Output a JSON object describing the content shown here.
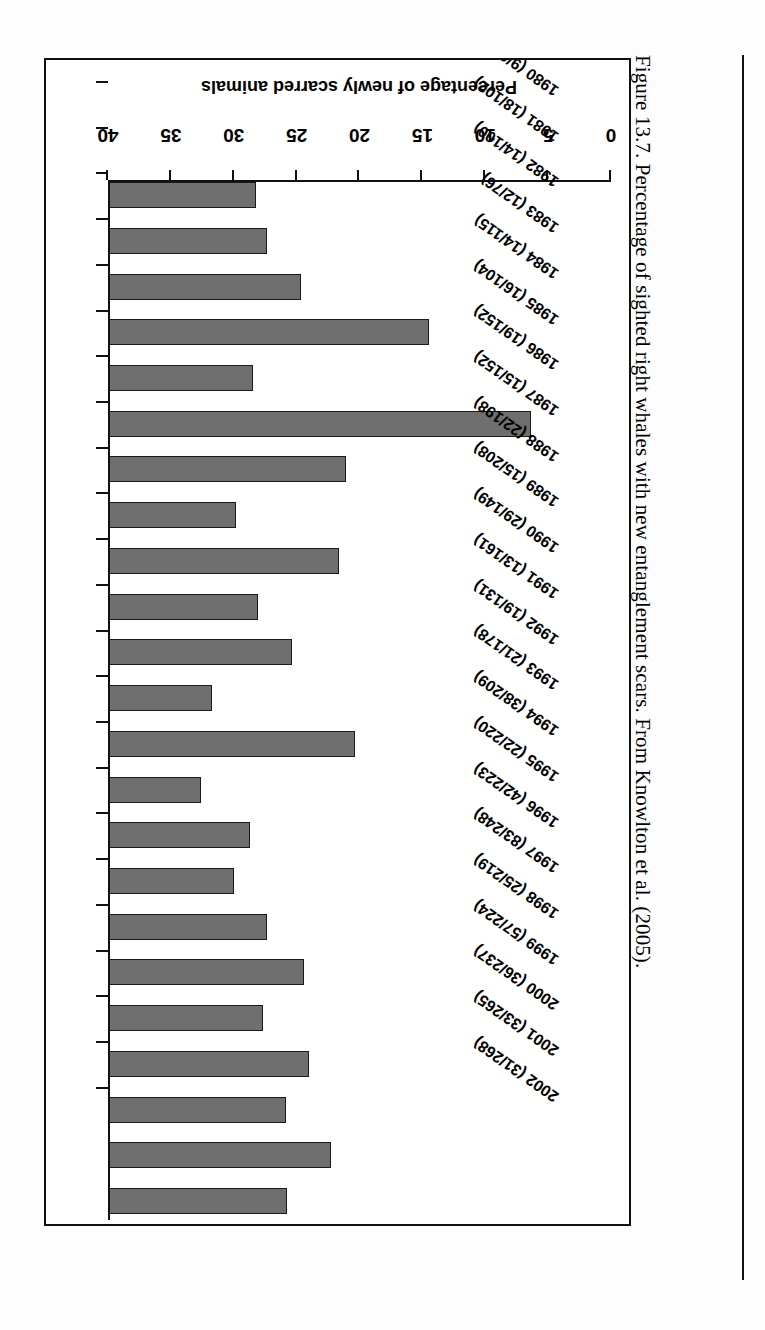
{
  "caption": {
    "text": "Figure 13.7.  Percentage of sighted right whales with new entanglement scars. From Knowlton et al. (2005)."
  },
  "chart_data": {
    "type": "bar",
    "orientation": "horizontal",
    "title": "",
    "xlabel": "",
    "ylabel": "Percentage of newly scarred animals",
    "ylim": [
      0,
      40
    ],
    "ticks": [
      0,
      5,
      10,
      15,
      20,
      25,
      30,
      35,
      40
    ],
    "grid": false,
    "legend": false,
    "bar_color": "#6f6f6f",
    "bar_edge_color": "#1a1a1a",
    "categories": [
      "1980 (9/64)",
      "1981 (18/102)",
      "1982 (14/100)",
      "1983 (12/76)",
      "1984 (14/115)",
      "1985 (16/104)",
      "1986 (19/152)",
      "1987 (15/152)",
      "1988 (22/198)",
      "1989 (15/208)",
      "1990 (29/149)",
      "1991 (13/161)",
      "1992 (19/131)",
      "1993 (21/178)",
      "1994 (38/209)",
      "1995 (22/220)",
      "1996 (42/223)",
      "1997 (83/248)",
      "1998 (25/219)",
      "1999 (57/224)",
      "2000 (36/237)",
      "2001 (33/265)",
      "2002 (31/268)"
    ],
    "values": [
      14.1,
      17.6,
      14.0,
      15.8,
      12.2,
      15.4,
      12.5,
      9.9,
      11.1,
      7.2,
      19.5,
      8.1,
      14.5,
      11.8,
      18.2,
      10.0,
      18.8,
      33.5,
      11.4,
      25.4,
      15.2,
      12.5,
      11.6
    ]
  }
}
